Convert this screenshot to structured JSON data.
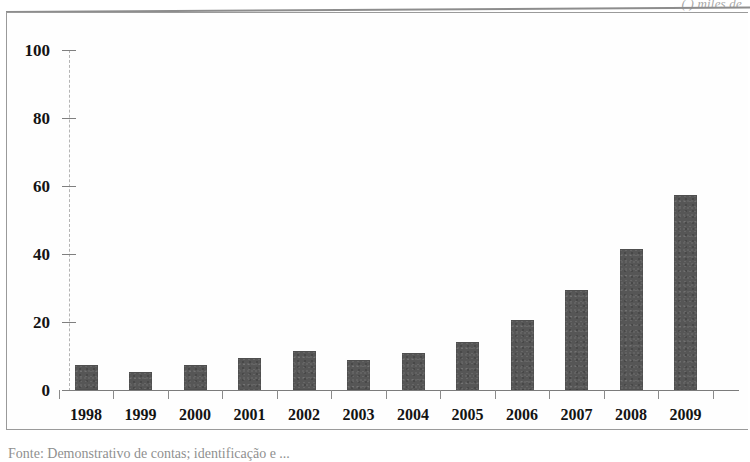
{
  "top_note": "(    ) miles de",
  "source_caption": "Fonte: Demonstrativo de contas;  identificação  e ...",
  "chart_data": {
    "type": "bar",
    "title": "",
    "xlabel": "",
    "ylabel": "",
    "categories": [
      "1998",
      "1999",
      "2000",
      "2001",
      "2002",
      "2003",
      "2004",
      "2005",
      "2006",
      "2007",
      "2008",
      "2009"
    ],
    "values": [
      7.5,
      5.2,
      7.3,
      9.3,
      11.5,
      8.7,
      11.0,
      14.0,
      20.5,
      29.5,
      41.5,
      57.5
    ],
    "ylim": [
      0,
      100
    ],
    "yticks": [
      0,
      20,
      40,
      60,
      80,
      100
    ],
    "ytick_labels": [
      "0",
      "20",
      "40",
      "60",
      "80",
      "100"
    ],
    "grid": false,
    "legend": false,
    "bar_color": "#565656",
    "series": [
      {
        "name": "serie-1",
        "values": [
          7.5,
          5.2,
          7.3,
          9.3,
          11.5,
          8.7,
          11.0,
          14.0,
          20.5,
          29.5,
          41.5,
          57.5
        ]
      }
    ]
  }
}
